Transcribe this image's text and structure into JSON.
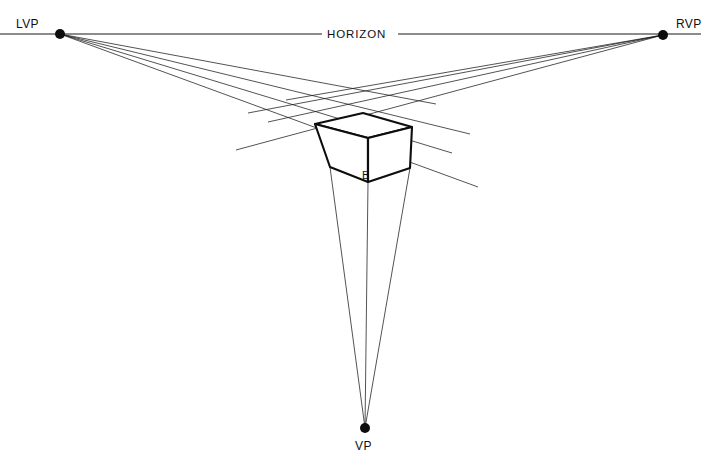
{
  "diagram": {
    "background_color": "#ffffff",
    "line_color": "#1a1a1a",
    "labels": {
      "left_vanishing_point": "LVP",
      "right_vanishing_point": "RVP",
      "vertical_vanishing_point": "VP",
      "horizon": "HORIZON",
      "cube_near_corner": "B"
    },
    "points": {
      "lvp": {
        "x": 60,
        "y": 34,
        "dot_radius": 5
      },
      "rvp": {
        "x": 663,
        "y": 35,
        "dot_radius": 5
      },
      "vp": {
        "x": 365,
        "y": 428,
        "dot_radius": 5
      }
    },
    "horizon_line": {
      "y": 34,
      "left_start_x": 0,
      "left_end_x": 322,
      "right_start_x": 398,
      "right_end_x": 701,
      "gap_label_x": 360
    },
    "cube_vertices": {
      "top_back": {
        "x": 363,
        "y": 113
      },
      "top_left": {
        "x": 315,
        "y": 124
      },
      "top_right": {
        "x": 412,
        "y": 127
      },
      "top_front": {
        "x": 368,
        "y": 138
      },
      "bottom_left": {
        "x": 330,
        "y": 167
      },
      "bottom_right": {
        "x": 410,
        "y": 168
      },
      "bottom_front": {
        "x": 368,
        "y": 182
      }
    },
    "construction_lines": {
      "from_lvp_targets": [
        {
          "x": 363,
          "y": 113,
          "extend_x": 436,
          "extend_y": 104
        },
        {
          "x": 412,
          "y": 127,
          "extend_x": 470,
          "extend_y": 134
        },
        {
          "x": 368,
          "y": 138,
          "extend_x": 452,
          "extend_y": 153
        },
        {
          "x": 410,
          "y": 168,
          "extend_x": 478,
          "extend_y": 187
        }
      ],
      "from_rvp_targets": [
        {
          "x": 363,
          "y": 113,
          "extend_x": 286,
          "extend_y": 100
        },
        {
          "x": 315,
          "y": 124,
          "extend_x": 248,
          "extend_y": 113
        },
        {
          "x": 368,
          "y": 138,
          "extend_x": 268,
          "extend_y": 122
        },
        {
          "x": 330,
          "y": 167,
          "extend_x": 236,
          "extend_y": 150
        }
      ],
      "to_vp_sources": [
        {
          "x": 330,
          "y": 167
        },
        {
          "x": 368,
          "y": 182
        },
        {
          "x": 410,
          "y": 168
        }
      ]
    },
    "label_positions": {
      "lvp": {
        "x": 16,
        "y": 28
      },
      "rvp": {
        "x": 676,
        "y": 28
      },
      "vp": {
        "x": 355,
        "y": 450
      },
      "horizon": {
        "x": 327,
        "y": 38
      },
      "b": {
        "x": 362,
        "y": 179
      }
    }
  }
}
